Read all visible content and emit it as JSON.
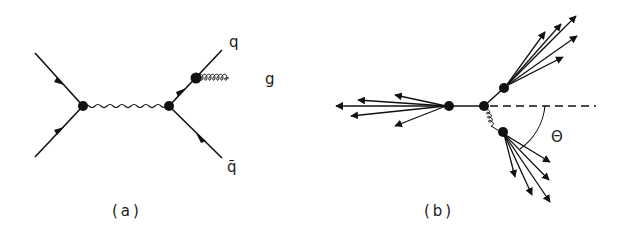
{
  "figure": {
    "panels": [
      {
        "id": "a",
        "caption": "(a)",
        "description": "Feynman diagram: quark-antiquark annihilation via photon/Z into q qbar with gluon radiation off outgoing quark",
        "labels": {
          "quark": "q",
          "gluon": "g",
          "antiquark": "q̄"
        }
      },
      {
        "id": "b",
        "caption": "(b)",
        "description": "Three-jet event topology: back-to-back jet on left, quark jet upper right, gluon jet lower right at angle Theta",
        "labels": {
          "angle": "Θ"
        }
      }
    ],
    "colors": {
      "ink": "#111111",
      "background": "#ffffff"
    }
  }
}
